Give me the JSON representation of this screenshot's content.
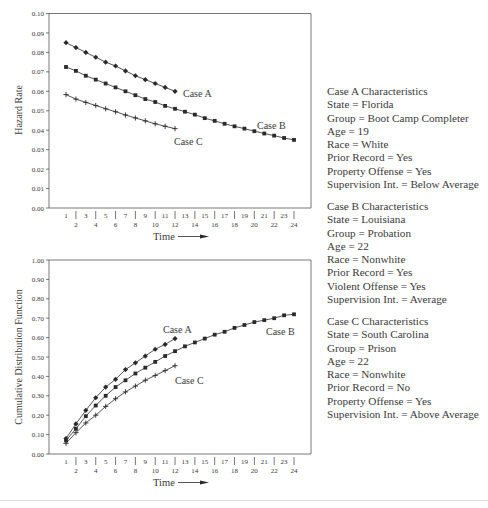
{
  "chart_data": [
    {
      "type": "line",
      "title": "",
      "xlabel": "Time",
      "ylabel": "Hazard Rate",
      "ylim": [
        0.0,
        0.1
      ],
      "yticks": [
        "0.00",
        "0.01",
        "0.02",
        "0.03",
        "0.04",
        "0.05",
        "0.06",
        "0.07",
        "0.08",
        "0.09",
        "0.10"
      ],
      "xticks": [
        1,
        2,
        3,
        4,
        5,
        6,
        7,
        8,
        9,
        10,
        11,
        12,
        13,
        14,
        15,
        16,
        17,
        18,
        19,
        20,
        21,
        22,
        23,
        24
      ],
      "grid": false,
      "series": [
        {
          "name": "Case A",
          "marker": "diamond",
          "x": [
            1,
            2,
            3,
            4,
            5,
            6,
            7,
            8,
            9,
            10,
            11,
            12
          ],
          "values": [
            0.085,
            0.0825,
            0.08,
            0.0775,
            0.075,
            0.073,
            0.0705,
            0.068,
            0.066,
            0.064,
            0.062,
            0.06
          ]
        },
        {
          "name": "Case B",
          "marker": "square",
          "x": [
            1,
            2,
            3,
            4,
            5,
            6,
            7,
            8,
            9,
            10,
            11,
            12,
            13,
            14,
            15,
            16,
            17,
            18,
            19,
            20,
            21,
            22,
            23,
            24
          ],
          "values": [
            0.0725,
            0.0705,
            0.068,
            0.066,
            0.064,
            0.062,
            0.06,
            0.058,
            0.056,
            0.0545,
            0.0525,
            0.051,
            0.0495,
            0.048,
            0.0462,
            0.0448,
            0.0433,
            0.042,
            0.0408,
            0.0395,
            0.0383,
            0.0372,
            0.036,
            0.035
          ]
        },
        {
          "name": "Case C",
          "marker": "plus",
          "x": [
            1,
            2,
            3,
            4,
            5,
            6,
            7,
            8,
            9,
            10,
            11,
            12
          ],
          "values": [
            0.0583,
            0.056,
            0.0543,
            0.0527,
            0.051,
            0.0495,
            0.0478,
            0.0463,
            0.0448,
            0.0433,
            0.042,
            0.0408
          ]
        }
      ],
      "annotations": [
        {
          "text": "Case A",
          "series": "Case A"
        },
        {
          "text": "Case B",
          "series": "Case B"
        },
        {
          "text": "Case C",
          "series": "Case C"
        }
      ]
    },
    {
      "type": "line",
      "title": "",
      "xlabel": "Time",
      "ylabel": "Cumulative Distribution Function",
      "ylim": [
        0.0,
        1.0
      ],
      "yticks": [
        "0.00",
        "0.10",
        "0.20",
        "0.30",
        "0.40",
        "0.50",
        "0.60",
        "0.70",
        "0.80",
        "0.90",
        "1.00"
      ],
      "xticks": [
        1,
        2,
        3,
        4,
        5,
        6,
        7,
        8,
        9,
        10,
        11,
        12,
        13,
        14,
        15,
        16,
        17,
        18,
        19,
        20,
        21,
        22,
        23,
        24
      ],
      "grid": false,
      "series": [
        {
          "name": "Case A",
          "marker": "diamond",
          "x": [
            1,
            2,
            3,
            4,
            5,
            6,
            7,
            8,
            9,
            10,
            11,
            12
          ],
          "values": [
            0.08,
            0.155,
            0.225,
            0.29,
            0.345,
            0.385,
            0.435,
            0.47,
            0.505,
            0.54,
            0.565,
            0.595
          ]
        },
        {
          "name": "Case B",
          "marker": "square",
          "x": [
            1,
            2,
            3,
            4,
            5,
            6,
            7,
            8,
            9,
            10,
            11,
            12,
            13,
            14,
            15,
            16,
            17,
            18,
            19,
            20,
            21,
            22,
            23,
            24
          ],
          "values": [
            0.07,
            0.13,
            0.195,
            0.25,
            0.3,
            0.345,
            0.38,
            0.415,
            0.445,
            0.475,
            0.505,
            0.53,
            0.555,
            0.575,
            0.595,
            0.615,
            0.63,
            0.65,
            0.665,
            0.68,
            0.69,
            0.7,
            0.715,
            0.72
          ]
        },
        {
          "name": "Case C",
          "marker": "plus",
          "x": [
            1,
            2,
            3,
            4,
            5,
            6,
            7,
            8,
            9,
            10,
            11,
            12
          ],
          "values": [
            0.055,
            0.11,
            0.16,
            0.2,
            0.245,
            0.285,
            0.32,
            0.35,
            0.38,
            0.405,
            0.43,
            0.455
          ]
        }
      ],
      "annotations": [
        {
          "text": "Case A",
          "series": "Case A"
        },
        {
          "text": "Case B",
          "series": "Case B"
        },
        {
          "text": "Case C",
          "series": "Case C"
        }
      ]
    }
  ],
  "axis": {
    "time_label": "Time",
    "hazard_label": "Hazard Rate",
    "cdf_label": "Cumulative Distribution Function"
  },
  "case_labels": {
    "a": "Case A",
    "b": "Case B",
    "c": "Case C"
  },
  "characteristics": [
    {
      "title": "Case A Characteristics",
      "lines": [
        "State = Florida",
        "Group = Boot Camp Completer",
        "Age = 19",
        "Race = White",
        "Prior Record = Yes",
        "Property Offense = Yes",
        "Supervision Int. = Below Average"
      ]
    },
    {
      "title": "Case B Characteristics",
      "lines": [
        "State = Louisiana",
        "Group = Probation",
        "Age = 22",
        "Race = Nonwhite",
        "Prior Record = Yes",
        "Violent Offense = Yes",
        "Supervision Int. = Average"
      ]
    },
    {
      "title": "Case C Characteristics",
      "lines": [
        "State = South Carolina",
        "Group = Prison",
        "Age = 22",
        "Race = Nonwhite",
        "Prior Record = No",
        "Property Offense = Yes",
        "Supervision Int. = Above Average"
      ]
    }
  ],
  "colors": {
    "line": "#2a2a2a",
    "axis": "#555555",
    "text": "#3a3a3a",
    "background": "#ffffff"
  }
}
